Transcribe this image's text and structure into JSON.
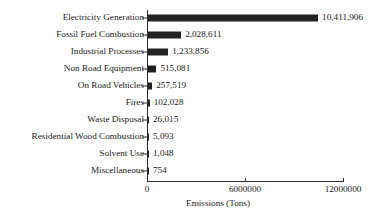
{
  "chart_data": {
    "type": "bar",
    "orientation": "horizontal",
    "title": "",
    "xlabel": "Emissions (Tons)",
    "ylabel": "",
    "xlim": [
      0,
      12000000
    ],
    "xticks": [
      0,
      6000000,
      12000000
    ],
    "xtick_labels": [
      "0",
      "6000000",
      "12000000"
    ],
    "grid": false,
    "legend": false,
    "bar_color": "#232323",
    "axis_color": "#2b2b2b",
    "background": "#ffffff",
    "categories": [
      "Electricity Generation",
      "Fossil Fuel Combustion",
      "Industrial Processes",
      "Non Road Equipment",
      "On Road Vehicles",
      "Fires",
      "Waste Disposal",
      "Residential Wood Combustion",
      "Solvent Use",
      "Miscellaneous"
    ],
    "values": [
      10411906,
      2028611,
      1233856,
      515081,
      257519,
      102028,
      26015,
      5093,
      1048,
      754
    ],
    "value_labels": [
      "10,411,906",
      "2,028,611",
      "1,233,856",
      "515,081",
      "257,519",
      "102,028",
      "26,015",
      "5,093",
      "1,048",
      "754"
    ]
  }
}
